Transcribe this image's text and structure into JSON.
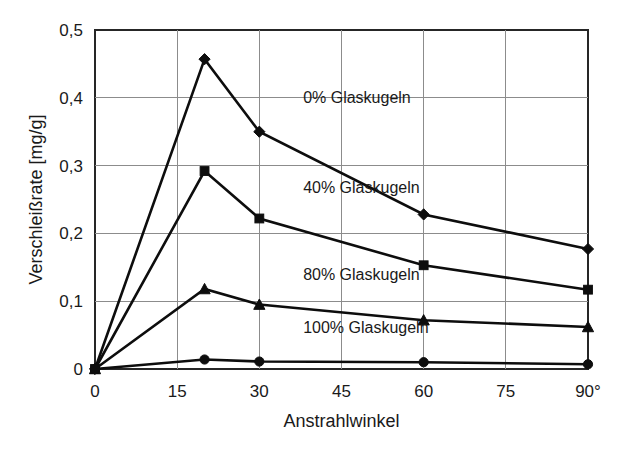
{
  "chart_data": {
    "type": "line",
    "title": "",
    "xlabel": "Anstrahlwinkel",
    "ylabel": "Verschleißrate [mg/g]",
    "xlim": [
      0,
      90
    ],
    "ylim": [
      0,
      0.5
    ],
    "grid": true,
    "legend_position": "inline-annotations",
    "x_tick_labels": [
      "0",
      "15",
      "30",
      "45",
      "60",
      "75",
      "90°"
    ],
    "x_ticks": [
      0,
      15,
      30,
      45,
      60,
      75,
      90
    ],
    "y_tick_labels": [
      "0",
      "0,1",
      "0,2",
      "0,3",
      "0,4",
      "0,5"
    ],
    "y_ticks": [
      0,
      0.1,
      0.2,
      0.3,
      0.4,
      0.5
    ],
    "x": [
      0,
      20,
      30,
      60,
      90
    ],
    "series": [
      {
        "name": "0% Glaskugeln",
        "marker": "diamond",
        "values": [
          0.0,
          0.457,
          0.35,
          0.228,
          0.177
        ],
        "label_x": 38,
        "label_y": 0.393
      },
      {
        "name": "40% Glaskugeln",
        "marker": "square",
        "values": [
          0.0,
          0.292,
          0.222,
          0.153,
          0.117
        ],
        "label_x": 38,
        "label_y": 0.26
      },
      {
        "name": "80% Glaskugeln",
        "marker": "triangle",
        "values": [
          0.0,
          0.118,
          0.095,
          0.072,
          0.062
        ],
        "label_x": 38,
        "label_y": 0.132
      },
      {
        "name": "100% Glaskugeln",
        "marker": "circle",
        "values": [
          0.0,
          0.014,
          0.011,
          0.01,
          0.007
        ],
        "label_x": 38,
        "label_y": 0.053
      }
    ],
    "colors": {
      "line": "#0d0d0d",
      "grid": "#8c8c8c",
      "frame": "#262626",
      "background": "#ffffff",
      "text": "#1a1a1a"
    }
  }
}
